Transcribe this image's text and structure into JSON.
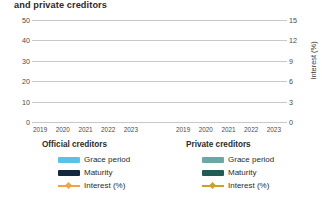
{
  "chart_data": {
    "type": "bar",
    "title": "and private creditors",
    "panels": [
      {
        "name": "Official creditors",
        "categories": [
          "2019",
          "2020",
          "2021",
          "2022",
          "2023"
        ],
        "series": [
          {
            "name": "Grace period",
            "axis": "left",
            "values": [
              null,
              null,
              null,
              null,
              null
            ],
            "color": "#5bc2e7"
          },
          {
            "name": "Maturity",
            "axis": "left",
            "values": [
              null,
              null,
              null,
              null,
              null
            ],
            "color": "#12283c"
          },
          {
            "name": "Interest (%)",
            "axis": "right",
            "values": [
              null,
              null,
              null,
              null,
              null
            ],
            "color": "#f5a04a"
          }
        ]
      },
      {
        "name": "Private creditors",
        "categories": [
          "2019",
          "2020",
          "2021",
          "2022",
          "2023"
        ],
        "series": [
          {
            "name": "Grace period",
            "axis": "left",
            "values": [
              null,
              null,
              null,
              null,
              null
            ],
            "color": "#6aa9a3"
          },
          {
            "name": "Maturity",
            "axis": "left",
            "values": [
              null,
              null,
              null,
              null,
              null
            ],
            "color": "#1f5c55"
          },
          {
            "name": "Interest (%)",
            "axis": "right",
            "values": [
              null,
              null,
              null,
              null,
              null
            ],
            "color": "#c9a227"
          }
        ]
      }
    ],
    "y_left": {
      "label": "Years",
      "ticks": [
        0,
        10,
        20,
        30,
        40,
        50
      ],
      "lim": [
        0,
        50
      ]
    },
    "y_right": {
      "label": "Interest (%)",
      "ticks": [
        0,
        3,
        6,
        9,
        12,
        15
      ],
      "lim": [
        0,
        15
      ]
    },
    "xlabel": "",
    "grid": "horizontal",
    "legend_position": "below"
  },
  "title": "and private creditors",
  "axes": {
    "left": {
      "label": "Years",
      "ticks": [
        "50",
        "40",
        "30",
        "20",
        "10",
        "0"
      ]
    },
    "right": {
      "label": "Interest (%)",
      "ticks": [
        "15",
        "12",
        "9",
        "6",
        "3",
        "0"
      ]
    },
    "x": {
      "left_panel": [
        "2019",
        "2020",
        "2021",
        "2022",
        "2023"
      ],
      "right_panel": [
        "2019",
        "2020",
        "2021",
        "2022",
        "2023"
      ]
    }
  },
  "legends": {
    "official": {
      "title": "Official creditors",
      "items": [
        {
          "label": "Grace period",
          "color": "#5bc2e7",
          "kind": "bar"
        },
        {
          "label": "Maturity",
          "color": "#12283c",
          "kind": "bar"
        },
        {
          "label": "Interest (%)",
          "color": "#f5a04a",
          "kind": "line"
        }
      ]
    },
    "private": {
      "title": "Private creditors",
      "items": [
        {
          "label": "Grace period",
          "color": "#6aa9a3",
          "kind": "bar"
        },
        {
          "label": "Maturity",
          "color": "#1f5c55",
          "kind": "bar"
        },
        {
          "label": "Interest (%)",
          "color": "#c9a227",
          "kind": "line"
        }
      ]
    }
  },
  "colors": {
    "gridline": "#c8c8c8",
    "text": "#3b3b3b",
    "background": "#ffffff"
  }
}
